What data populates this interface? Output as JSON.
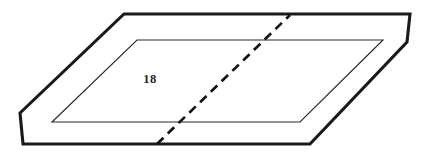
{
  "figure": {
    "kind": "technical-line-drawing",
    "background_color": "#ffffff",
    "canvas": {
      "width": 433,
      "height": 156
    },
    "labels": [
      {
        "name": "part-number-label",
        "text": "18",
        "x": 150,
        "y": 83,
        "font_size": 12.5,
        "color": "#232323"
      }
    ],
    "shapes": {
      "outer_plate": {
        "name": "outer-plate-outline",
        "stroke": "#1a1a1a",
        "stroke_width": 3.1,
        "fill": "#ffffff",
        "points": "124,14 410,14 407,42 310,144 23,144 20,113"
      },
      "inner_face": {
        "name": "inner-recess-outline",
        "stroke": "#2a2a2a",
        "stroke_width": 1.15,
        "fill": "#ffffff",
        "points": "137,40 383,40 300,122 52,122"
      },
      "section_line": {
        "name": "dashed-section-line",
        "stroke": "#141414",
        "stroke_width": 2.7,
        "dash_pattern": "9 6",
        "x1": 157,
        "y1": 144,
        "x2": 290,
        "y2": 15
      }
    }
  }
}
